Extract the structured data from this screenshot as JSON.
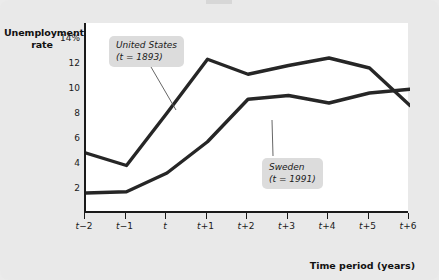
{
  "chart_data": {
    "type": "line",
    "title": "",
    "xlabel": "Time period (years)",
    "ylabel": "Unemployment rate",
    "x": [
      "t-2",
      "t-1",
      "t",
      "t+1",
      "t+2",
      "t+3",
      "t+4",
      "t+5",
      "t+6"
    ],
    "xtick_labels": [
      "t−2",
      "t−1",
      "t",
      "t+1",
      "t+2",
      "t+3",
      "t+4",
      "t+5",
      "t+6"
    ],
    "ytick_labels": [
      "14%",
      "12",
      "10",
      "8",
      "6",
      "4",
      "2"
    ],
    "ytick_values": [
      14,
      12,
      10,
      8,
      6,
      4,
      2
    ],
    "ylim": [
      0,
      15.2
    ],
    "grid": false,
    "legend_position": "annotations",
    "series": [
      {
        "name": "United States",
        "annotation": "(t = 1893)",
        "values": [
          4.8,
          3.8,
          8.0,
          12.3,
          11.1,
          11.8,
          12.4,
          11.6,
          8.6
        ],
        "color": "#262626"
      },
      {
        "name": "Sweden",
        "annotation": "(t = 1991)",
        "values": [
          1.6,
          1.7,
          3.2,
          5.7,
          9.1,
          9.4,
          8.8,
          9.6,
          9.9
        ],
        "color": "#262626"
      }
    ],
    "annotations": [
      {
        "label": "United States",
        "sublabel": "(t = 1893)"
      },
      {
        "label": "Sweden",
        "sublabel": "(t = 1991)"
      }
    ]
  },
  "axes": {
    "y_title_line1": "Unemployment",
    "y_title_line2": "rate",
    "x_title": "Time period (years)"
  },
  "colors": {
    "background": "#e9e9e9",
    "plot_background": "#ffffff",
    "axis": "#1a1a1a",
    "line": "#262626",
    "callout_background": "#dcdcdc"
  }
}
